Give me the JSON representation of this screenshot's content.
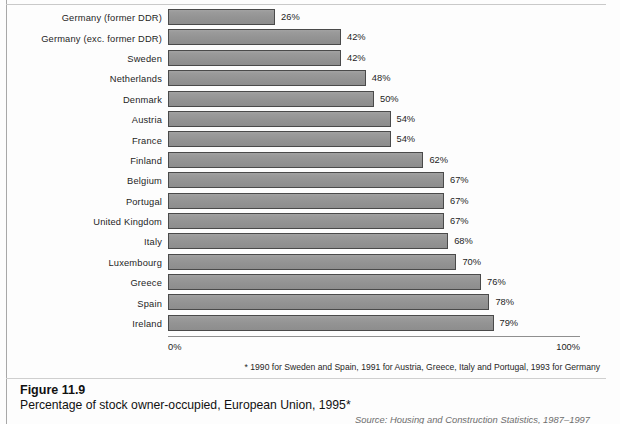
{
  "chart_data": {
    "type": "bar",
    "orientation": "horizontal",
    "title": "Percentage of stock owner-occupied, European Union, 1995*",
    "xlabel": "",
    "ylabel": "",
    "xlim": [
      0,
      100
    ],
    "grid": false,
    "legend": null,
    "value_suffix": "%",
    "categories": [
      "Germany (former DDR)",
      "Germany (exc. former DDR)",
      "Sweden",
      "Netherlands",
      "Denmark",
      "Austria",
      "France",
      "Finland",
      "Belgium",
      "Portugal",
      "United Kingdom",
      "Italy",
      "Luxembourg",
      "Greece",
      "Spain",
      "Ireland"
    ],
    "values": [
      26,
      42,
      42,
      48,
      50,
      54,
      54,
      62,
      67,
      67,
      67,
      68,
      70,
      76,
      78,
      79
    ],
    "value_labels": [
      "26%",
      "42%",
      "42%",
      "48%",
      "50%",
      "54%",
      "54%",
      "62%",
      "67%",
      "67%",
      "67%",
      "68%",
      "70%",
      "76%",
      "78%",
      "79%"
    ]
  },
  "axis": {
    "min_label": "0%",
    "max_label": "100%"
  },
  "footnote": "* 1990 for Sweden and Spain, 1991 for Austria, Greece, Italy and Portugal, 1993 for Germany",
  "caption": {
    "number": "Figure 11.9",
    "title": "Percentage of stock owner-occupied, European Union, 1995*",
    "source": "Source: Housing and Construction Statistics, 1987–1997"
  },
  "colors": {
    "bar_fill": "#979797",
    "bar_border": "#4a4a4a",
    "text": "#1d1d1d",
    "axis": "#8f8f8f"
  }
}
